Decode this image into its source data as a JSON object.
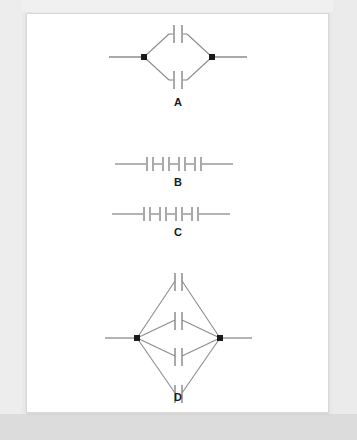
{
  "document": {
    "background_color": "#e9e9e9",
    "page_color": "#ffffff",
    "page_border_color": "#d9d9d9"
  },
  "figure": {
    "title": "",
    "stroke_color": "#8c8c8c",
    "node_color": "#1a1a1a",
    "label_color": "#1a1a1a",
    "diagrams": [
      {
        "id": "A",
        "label": "A",
        "type": "two-branch-parallel",
        "description": "Two capacitors in parallel between two terminal nodes, arranged as a diamond/rhombus with one capacitor on the upper branch and one on the lower branch.",
        "capacitor_count": 2,
        "branch_count": 2,
        "capacitors_per_branch": 1,
        "node_count": 2,
        "label_x": 151,
        "label_y": 92
      },
      {
        "id": "B",
        "label": "B",
        "type": "series",
        "description": "Four capacitors connected in series along a single horizontal wire.",
        "capacitor_count": 4,
        "branch_count": 1,
        "capacitors_per_branch": 4,
        "node_count": 0,
        "label_x": 151,
        "label_y": 172
      },
      {
        "id": "C",
        "label": "C",
        "type": "series",
        "description": "Four capacitors connected in series along a single horizontal wire.",
        "capacitor_count": 4,
        "branch_count": 1,
        "capacitors_per_branch": 4,
        "node_count": 0,
        "label_x": 151,
        "label_y": 222
      },
      {
        "id": "D",
        "label": "D",
        "type": "four-branch-parallel",
        "description": "Four capacitors in parallel between two terminal nodes, drawn as a tall lens/diamond with four stacked branches each carrying one capacitor.",
        "capacitor_count": 4,
        "branch_count": 4,
        "capacitors_per_branch": 1,
        "node_count": 2,
        "label_x": 151,
        "label_y": 387
      }
    ]
  }
}
